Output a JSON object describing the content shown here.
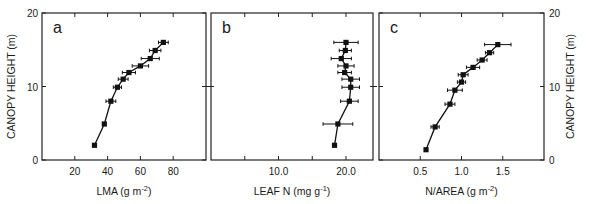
{
  "chart_data": [
    {
      "type": "line",
      "panel_label": "a",
      "title": "",
      "xlabel": "LMA (g m",
      "xlabel_sup": "-2",
      "xlabel_suffix": ")",
      "ylabel": "CANOPY HEIGHT (m)",
      "xlim": [
        0,
        100
      ],
      "ylim": [
        0,
        20
      ],
      "xticks": [
        20,
        40,
        60,
        80
      ],
      "xtick_labels": [
        "20",
        "40",
        "60",
        "80"
      ],
      "yticks": [
        0,
        10,
        20
      ],
      "ytick_labels": [
        "0",
        "10",
        "20"
      ],
      "grid": false,
      "series": [
        {
          "name": "LMA profile",
          "x": [
            74,
            69,
            66,
            60,
            53,
            49.5,
            46,
            42,
            38,
            32
          ],
          "y": [
            16.0,
            14.9,
            13.8,
            12.8,
            11.9,
            11.0,
            9.9,
            8.0,
            4.9,
            2.0
          ],
          "xerr": [
            3,
            3.5,
            5.5,
            5,
            4,
            3,
            2.5,
            3,
            0,
            0
          ]
        }
      ]
    },
    {
      "type": "line",
      "panel_label": "b",
      "title": "",
      "xlabel": "LEAF N (mg g",
      "xlabel_sup": "-1",
      "xlabel_suffix": ")",
      "ylabel": "",
      "xlim": [
        0,
        24
      ],
      "ylim": [
        0,
        20
      ],
      "xticks": [
        10,
        20
      ],
      "xtick_labels": [
        "10.0",
        "20.0"
      ],
      "minor_xticks": [
        5,
        15
      ],
      "yticks": [
        10
      ],
      "grid": false,
      "series": [
        {
          "name": "Leaf N profile",
          "x": [
            20.0,
            19.9,
            19.3,
            20.0,
            19.8,
            20.7,
            20.7,
            20.5,
            18.8,
            18.3
          ],
          "y": [
            16.0,
            14.9,
            13.8,
            12.8,
            11.9,
            11.0,
            9.9,
            8.0,
            4.9,
            2.0
          ],
          "xerr": [
            1.8,
            0.9,
            1.5,
            1.2,
            1.0,
            1.3,
            1.3,
            1.3,
            2.2,
            0
          ]
        }
      ]
    },
    {
      "type": "line",
      "panel_label": "c",
      "title": "",
      "xlabel": "N/AREA  (g m",
      "xlabel_sup": "-2",
      "xlabel_suffix": ")",
      "ylabel": "CANOPY HEIGHT (m)",
      "ylabel_position": "right",
      "xlim": [
        0,
        2.0
      ],
      "ylim": [
        0,
        20
      ],
      "xticks": [
        0.5,
        1.0,
        1.5
      ],
      "xtick_labels": [
        "0.5",
        "1.0",
        "1.5"
      ],
      "yticks": [
        0,
        10,
        20
      ],
      "ytick_labels": [
        "0",
        "10",
        "20"
      ],
      "grid": false,
      "series": [
        {
          "name": "N per area profile",
          "x": [
            1.44,
            1.34,
            1.25,
            1.14,
            1.02,
            1.0,
            0.92,
            0.86,
            0.68,
            0.57
          ],
          "y": [
            15.7,
            14.6,
            13.6,
            12.6,
            11.6,
            10.6,
            9.5,
            7.6,
            4.5,
            1.4
          ],
          "xerr": [
            0.16,
            0.05,
            0.06,
            0.08,
            0.06,
            0.05,
            0.09,
            0.06,
            0.05,
            0
          ]
        }
      ]
    }
  ],
  "layout": {
    "plot_top": 13,
    "plot_bottom": 160,
    "panels_px": [
      [
        42,
        206
      ],
      [
        211,
        373
      ],
      [
        379,
        544
      ]
    ]
  }
}
